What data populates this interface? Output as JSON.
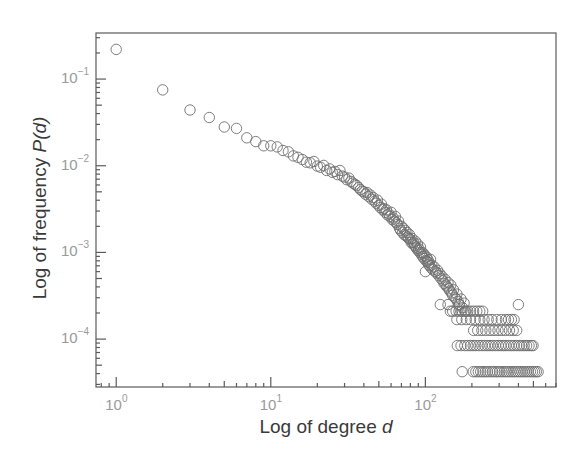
{
  "chart_data": {
    "type": "scatter",
    "title": "",
    "xlabel": "Log of degree d",
    "ylabel": "Log of frequency P(d)",
    "xlabel_parts": {
      "text": "Log of degree ",
      "var": "d"
    },
    "ylabel_parts": {
      "text": "Log of frequency ",
      "var": "P(d)"
    },
    "xscale": "log",
    "yscale": "log",
    "xlim": [
      0.74,
      700
    ],
    "ylim": [
      2.8e-05,
      0.34
    ],
    "grid": false,
    "legend": null,
    "marker": "open-circle",
    "marker_color": "#6e6e6e",
    "axis_color": "#5a5a5a",
    "x_ticks": [
      {
        "base": "10",
        "exp": "0",
        "value": 1
      },
      {
        "base": "10",
        "exp": "1",
        "value": 10
      },
      {
        "base": "10",
        "exp": "2",
        "value": 100
      }
    ],
    "y_ticks": [
      {
        "base": "10",
        "exp": "−1",
        "value": 0.1
      },
      {
        "base": "10",
        "exp": "−2",
        "value": 0.01
      },
      {
        "base": "10",
        "exp": "−3",
        "value": 0.001
      },
      {
        "base": "10",
        "exp": "−4",
        "value": 0.0001
      }
    ],
    "points": [
      [
        1,
        0.22
      ],
      [
        2,
        0.075
      ],
      [
        3,
        0.044
      ],
      [
        4,
        0.036
      ],
      [
        5,
        0.028
      ],
      [
        6,
        0.027
      ],
      [
        7,
        0.021
      ],
      [
        8,
        0.019
      ],
      [
        9,
        0.017
      ],
      [
        10,
        0.017
      ],
      [
        11,
        0.0165
      ],
      [
        12,
        0.015
      ],
      [
        13,
        0.0145
      ],
      [
        14,
        0.013
      ],
      [
        15,
        0.0125
      ],
      [
        16,
        0.0118
      ],
      [
        17,
        0.011
      ],
      [
        18,
        0.0108
      ],
      [
        19,
        0.0112
      ],
      [
        20,
        0.0099
      ],
      [
        21,
        0.0096
      ],
      [
        22,
        0.0101
      ],
      [
        23,
        0.0088
      ],
      [
        24,
        0.0092
      ],
      [
        25,
        0.0084
      ],
      [
        26,
        0.0086
      ],
      [
        27,
        0.0079
      ],
      [
        28,
        0.0088
      ],
      [
        29,
        0.0076
      ],
      [
        30,
        0.0074
      ],
      [
        31,
        0.0069
      ],
      [
        32,
        0.0072
      ],
      [
        33,
        0.0066
      ],
      [
        34,
        0.0063
      ],
      [
        35,
        0.0061
      ],
      [
        36,
        0.0059
      ],
      [
        37,
        0.0056
      ],
      [
        38,
        0.0053
      ],
      [
        39,
        0.0051
      ],
      [
        40,
        0.005
      ],
      [
        41,
        0.0047
      ],
      [
        42,
        0.0049
      ],
      [
        43,
        0.0044
      ],
      [
        44,
        0.0046
      ],
      [
        45,
        0.0041
      ],
      [
        46,
        0.0043
      ],
      [
        47,
        0.0039
      ],
      [
        48,
        0.0037
      ],
      [
        49,
        0.004
      ],
      [
        50,
        0.0035
      ],
      [
        51,
        0.0033
      ],
      [
        52,
        0.0036
      ],
      [
        53,
        0.0031
      ],
      [
        54,
        0.0032
      ],
      [
        55,
        0.0029
      ],
      [
        56,
        0.0031
      ],
      [
        57,
        0.0027
      ],
      [
        58,
        0.0028
      ],
      [
        59,
        0.0026
      ],
      [
        60,
        0.0029
      ],
      [
        61,
        0.0024
      ],
      [
        62,
        0.0025
      ],
      [
        63,
        0.0023
      ],
      [
        64,
        0.0026
      ],
      [
        65,
        0.0022
      ],
      [
        66,
        0.0021
      ],
      [
        67,
        0.0023
      ],
      [
        68,
        0.0019
      ],
      [
        69,
        0.0018
      ],
      [
        70,
        0.002
      ],
      [
        71,
        0.0017
      ],
      [
        72,
        0.0019
      ],
      [
        73,
        0.0016
      ],
      [
        74,
        0.0018
      ],
      [
        75,
        0.00155
      ],
      [
        76,
        0.0017
      ],
      [
        77,
        0.0015
      ],
      [
        78,
        0.00145
      ],
      [
        79,
        0.0016
      ],
      [
        80,
        0.0014
      ],
      [
        81,
        0.0013
      ],
      [
        82,
        0.00145
      ],
      [
        83,
        0.00125
      ],
      [
        84,
        0.0013
      ],
      [
        85,
        0.0012
      ],
      [
        86,
        0.00135
      ],
      [
        87,
        0.00115
      ],
      [
        88,
        0.0011
      ],
      [
        89,
        0.00125
      ],
      [
        90,
        0.00105
      ],
      [
        91,
        0.0011
      ],
      [
        92,
        0.001
      ],
      [
        93,
        0.00115
      ],
      [
        94,
        0.00095
      ],
      [
        95,
        0.001
      ],
      [
        96,
        0.0009
      ],
      [
        97,
        0.00098
      ],
      [
        98,
        0.00085
      ],
      [
        99,
        0.00092
      ],
      [
        100,
        0.0006
      ],
      [
        101,
        0.0008
      ],
      [
        102,
        0.00088
      ],
      [
        103,
        0.00078
      ],
      [
        104,
        0.00082
      ],
      [
        105,
        0.00072
      ],
      [
        106,
        0.00076
      ],
      [
        107,
        0.0007
      ],
      [
        108,
        0.00083
      ],
      [
        109,
        0.00066
      ],
      [
        110,
        0.00071
      ],
      [
        112,
        0.00063
      ],
      [
        114,
        0.00068
      ],
      [
        116,
        0.0006
      ],
      [
        118,
        0.00058
      ],
      [
        120,
        0.00062
      ],
      [
        122,
        0.00054
      ],
      [
        124,
        0.00057
      ],
      [
        126,
        0.0005
      ],
      [
        128,
        0.00053
      ],
      [
        130,
        0.00047
      ],
      [
        132,
        0.00044
      ],
      [
        134,
        0.00049
      ],
      [
        136,
        0.00042
      ],
      [
        138,
        0.0004
      ],
      [
        140,
        0.00045
      ],
      [
        142,
        0.00038
      ],
      [
        144,
        0.00036
      ],
      [
        146,
        0.00042
      ],
      [
        148,
        0.00034
      ],
      [
        150,
        0.00032
      ],
      [
        152,
        0.00037
      ],
      [
        155,
        0.0003
      ],
      [
        158,
        0.00029
      ],
      [
        160,
        0.00033
      ],
      [
        163,
        0.00027
      ],
      [
        166,
        0.00025
      ],
      [
        170,
        0.00029
      ],
      [
        174,
        0.00023
      ],
      [
        178,
        0.00026
      ],
      [
        182,
        0.00021
      ],
      [
        125,
        0.00025
      ],
      [
        140,
        0.00025
      ],
      [
        165,
        0.00025
      ],
      [
        145,
        0.00021
      ],
      [
        150,
        0.00021
      ],
      [
        158,
        0.00021
      ],
      [
        165,
        0.00021
      ],
      [
        172,
        0.00021
      ],
      [
        180,
        0.00021
      ],
      [
        188,
        0.00021
      ],
      [
        196,
        0.00021
      ],
      [
        205,
        0.00021
      ],
      [
        215,
        0.00021
      ],
      [
        225,
        0.00021
      ],
      [
        235,
        0.00021
      ],
      [
        400,
        0.00025
      ],
      [
        160,
        0.000168
      ],
      [
        172,
        0.000168
      ],
      [
        184,
        0.000168
      ],
      [
        196,
        0.000168
      ],
      [
        210,
        0.000168
      ],
      [
        225,
        0.000168
      ],
      [
        240,
        0.000168
      ],
      [
        255,
        0.000168
      ],
      [
        270,
        0.000168
      ],
      [
        290,
        0.000168
      ],
      [
        310,
        0.000168
      ],
      [
        330,
        0.000168
      ],
      [
        345,
        0.000168
      ],
      [
        360,
        0.000168
      ],
      [
        375,
        0.000168
      ],
      [
        205,
        0.000126
      ],
      [
        218,
        0.000126
      ],
      [
        232,
        0.000126
      ],
      [
        246,
        0.000126
      ],
      [
        262,
        0.000126
      ],
      [
        278,
        0.000126
      ],
      [
        295,
        0.000126
      ],
      [
        312,
        0.000126
      ],
      [
        330,
        0.000126
      ],
      [
        350,
        0.000126
      ],
      [
        370,
        0.000126
      ],
      [
        390,
        0.000126
      ],
      [
        161,
        8.4e-05
      ],
      [
        170,
        8.4e-05
      ],
      [
        180,
        8.4e-05
      ],
      [
        188,
        8.4e-05
      ],
      [
        196,
        8.4e-05
      ],
      [
        204,
        8.4e-05
      ],
      [
        212,
        8.4e-05
      ],
      [
        222,
        8.4e-05
      ],
      [
        232,
        8.4e-05
      ],
      [
        242,
        8.4e-05
      ],
      [
        252,
        8.4e-05
      ],
      [
        262,
        8.4e-05
      ],
      [
        272,
        8.4e-05
      ],
      [
        284,
        8.4e-05
      ],
      [
        296,
        8.4e-05
      ],
      [
        308,
        8.4e-05
      ],
      [
        320,
        8.4e-05
      ],
      [
        332,
        8.4e-05
      ],
      [
        346,
        8.4e-05
      ],
      [
        360,
        8.4e-05
      ],
      [
        374,
        8.4e-05
      ],
      [
        390,
        8.4e-05
      ],
      [
        405,
        8.4e-05
      ],
      [
        420,
        8.4e-05
      ],
      [
        436,
        8.4e-05
      ],
      [
        452,
        8.4e-05
      ],
      [
        468,
        8.4e-05
      ],
      [
        485,
        8.4e-05
      ],
      [
        497,
        8.4e-05
      ],
      [
        173,
        4.2e-05
      ],
      [
        204,
        4.2e-05
      ],
      [
        212,
        4.2e-05
      ],
      [
        220,
        4.2e-05
      ],
      [
        228,
        4.2e-05
      ],
      [
        236,
        4.2e-05
      ],
      [
        244,
        4.2e-05
      ],
      [
        252,
        4.2e-05
      ],
      [
        262,
        4.2e-05
      ],
      [
        272,
        4.2e-05
      ],
      [
        282,
        4.2e-05
      ],
      [
        292,
        4.2e-05
      ],
      [
        302,
        4.2e-05
      ],
      [
        313,
        4.2e-05
      ],
      [
        324,
        4.2e-05
      ],
      [
        335,
        4.2e-05
      ],
      [
        346,
        4.2e-05
      ],
      [
        358,
        4.2e-05
      ],
      [
        370,
        4.2e-05
      ],
      [
        382,
        4.2e-05
      ],
      [
        395,
        4.2e-05
      ],
      [
        408,
        4.2e-05
      ],
      [
        421,
        4.2e-05
      ],
      [
        435,
        4.2e-05
      ],
      [
        449,
        4.2e-05
      ],
      [
        463,
        4.2e-05
      ],
      [
        478,
        4.2e-05
      ],
      [
        493,
        4.2e-05
      ],
      [
        508,
        4.2e-05
      ],
      [
        522,
        4.2e-05
      ],
      [
        536,
        4.2e-05
      ]
    ]
  }
}
